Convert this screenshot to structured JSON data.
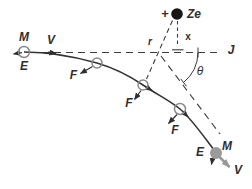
{
  "colors": {
    "background": "#ffffff",
    "ink": "#2f2f2f",
    "gray": "#9a9a9a",
    "nucleus_fill": "#161616",
    "circle_outline": "#8a8a8a"
  },
  "nucleus": {
    "charge_sign": "+",
    "label": "Ze"
  },
  "particle": {
    "mass": "M",
    "charge": "E",
    "velocity": "V"
  },
  "labels": {
    "force": "F",
    "radial_distance": "r",
    "perpendicular_distance": "x",
    "scattering_angle": "θ",
    "line_end": "J"
  }
}
